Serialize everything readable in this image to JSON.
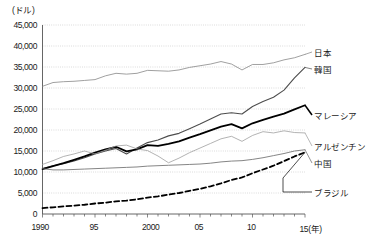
{
  "chart_data": {
    "type": "line",
    "title": "",
    "xlabel": "(年)",
    "ylabel": "(ドル)",
    "yunit": "(ドル)",
    "xunit": "(年)",
    "ylim": [
      0,
      45000
    ],
    "xlim": [
      1990,
      2015
    ],
    "grid": true,
    "legend_position": "right-inline",
    "yticks": [
      "0",
      "5,000",
      "10,000",
      "15,000",
      "20,000",
      "25,000",
      "30,000",
      "35,000",
      "40,000",
      "45,000"
    ],
    "ytick_values": [
      0,
      5000,
      10000,
      15000,
      20000,
      25000,
      30000,
      35000,
      40000,
      45000
    ],
    "xticks": [
      "1990",
      "95",
      "2000",
      "05",
      "10",
      "15"
    ],
    "xtick_values": [
      1990,
      1995,
      2000,
      2005,
      2010,
      2015
    ],
    "x": [
      1990,
      1991,
      1992,
      1993,
      1994,
      1995,
      1996,
      1997,
      1998,
      1999,
      2000,
      2001,
      2002,
      2003,
      2004,
      2005,
      2006,
      2007,
      2008,
      2009,
      2010,
      2011,
      2012,
      2013,
      2014,
      2015
    ],
    "series": [
      {
        "name": "日本",
        "label": "日本",
        "style": "solid-thin",
        "color": "#808080",
        "values": [
          30400,
          31300,
          31500,
          31600,
          31800,
          32000,
          32900,
          33500,
          33300,
          33500,
          34200,
          34100,
          34000,
          34300,
          34900,
          35300,
          35700,
          36300,
          35700,
          34300,
          35600,
          35600,
          36000,
          36700,
          37200,
          38000
        ]
      },
      {
        "name": "韓国",
        "label": "韓国",
        "style": "solid-medium",
        "color": "#4d4d4d",
        "values": [
          10800,
          11500,
          12000,
          12600,
          13400,
          14300,
          15000,
          15600,
          14300,
          15700,
          17000,
          17600,
          18600,
          19200,
          20300,
          21400,
          22600,
          23800,
          24100,
          23800,
          25600,
          26800,
          27800,
          29500,
          32400,
          34900
        ]
      },
      {
        "name": "マレーシア",
        "label": "マレーシア",
        "style": "solid-bold",
        "color": "#000000",
        "values": [
          10700,
          11400,
          12100,
          12900,
          13700,
          14600,
          15400,
          16000,
          14900,
          15400,
          16400,
          16200,
          16700,
          17300,
          18200,
          19000,
          19900,
          20800,
          21400,
          20400,
          21600,
          22400,
          23200,
          23900,
          24900,
          25900
        ]
      },
      {
        "name": "アルゼンチン",
        "label": "アルゼンチン",
        "style": "solid-thin",
        "color": "#999999",
        "values": [
          11800,
          12700,
          13700,
          14300,
          15000,
          14300,
          15200,
          16200,
          16400,
          15500,
          15100,
          13800,
          12200,
          13300,
          14600,
          15700,
          16800,
          17900,
          18500,
          17300,
          18700,
          19600,
          19300,
          19800,
          19400,
          19300
        ]
      },
      {
        "name": "中国",
        "label": "中国",
        "style": "solid-thin-dark",
        "color": "#666666",
        "values": [
          10800,
          10500,
          10500,
          10600,
          10700,
          10800,
          10900,
          11000,
          11100,
          11200,
          11400,
          11500,
          11600,
          11700,
          11800,
          11900,
          12100,
          12400,
          12600,
          12700,
          13000,
          13400,
          13900,
          14400,
          15000,
          15300
        ]
      },
      {
        "name": "ブラジル",
        "label": "ブラジル",
        "style": "dashed-bold",
        "color": "#000000",
        "values": [
          1400,
          1600,
          1800,
          2000,
          2200,
          2500,
          2700,
          3000,
          3200,
          3500,
          3900,
          4200,
          4600,
          5000,
          5500,
          6000,
          6600,
          7300,
          8100,
          8700,
          9700,
          10600,
          11500,
          12600,
          13700,
          14700
        ]
      }
    ],
    "series_label_positions": [
      {
        "name": "日本",
        "x": 314,
        "y": 52
      },
      {
        "name": "韓国",
        "x": 314,
        "y": 69
      },
      {
        "name": "マレーシア",
        "x": 314,
        "y": 115
      },
      {
        "name": "アルゼンチン",
        "x": 314,
        "y": 146
      },
      {
        "name": "中国",
        "x": 314,
        "y": 163
      },
      {
        "name": "ブラジル",
        "x": 314,
        "y": 192
      }
    ]
  },
  "axis": {
    "unit_y": "(ドル)",
    "unit_x": "(年)"
  }
}
